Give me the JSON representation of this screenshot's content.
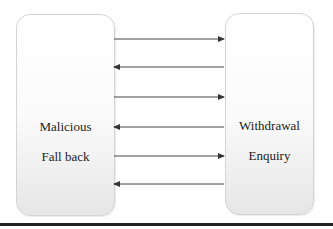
{
  "diagram": {
    "left_node": {
      "lines": [
        "Malicious",
        "Fall back"
      ]
    },
    "right_node": {
      "lines": [
        "Withdrawal",
        "Enquiry"
      ]
    },
    "arrows": [
      {
        "y": 39,
        "direction": "right"
      },
      {
        "y": 67,
        "direction": "left"
      },
      {
        "y": 97,
        "direction": "right"
      },
      {
        "y": 127,
        "direction": "left"
      },
      {
        "y": 156,
        "direction": "right"
      },
      {
        "y": 184,
        "direction": "left"
      }
    ],
    "colors": {
      "arrow": "#333333",
      "rule": "#222222",
      "box_border": "#d4d4d4"
    }
  }
}
